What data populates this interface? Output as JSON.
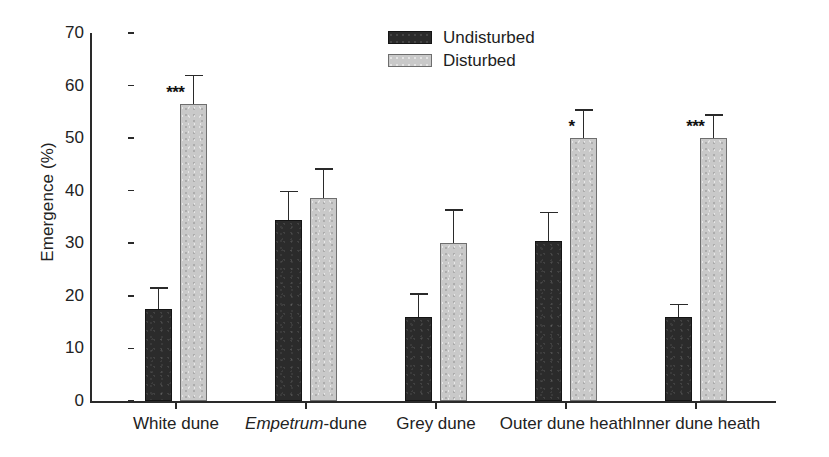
{
  "chart_data": {
    "type": "bar",
    "title": "",
    "xlabel": "",
    "ylabel": "Emergence (%)",
    "ylim": [
      0,
      70
    ],
    "yticks": [
      0,
      10,
      20,
      30,
      40,
      50,
      60,
      70
    ],
    "grid": false,
    "legend_position": "top-center-right",
    "categories": [
      "White dune",
      "Empetrum-dune",
      "Grey dune",
      "Outer dune heath",
      "Inner dune heath"
    ],
    "categories_html": [
      "White dune",
      "<i>Empetrum</i>-dune",
      "Grey dune",
      "Outer dune heath",
      "Inner dune heath"
    ],
    "series": [
      {
        "name": "Undisturbed",
        "color": "#2b2b2b",
        "values": [
          17.5,
          34.5,
          16.0,
          30.5,
          16.0
        ],
        "errors": [
          4.2,
          5.5,
          4.5,
          5.5,
          2.5
        ]
      },
      {
        "name": "Disturbed",
        "color": "#c9c9c9",
        "values": [
          56.5,
          38.6,
          30.0,
          50.0,
          50.0
        ],
        "errors": [
          5.6,
          5.7,
          6.5,
          5.5,
          4.6
        ]
      }
    ],
    "annotations": [
      {
        "category": "White dune",
        "series": "Disturbed",
        "text": "***"
      },
      {
        "category": "Outer dune heath",
        "series": "Disturbed",
        "text": "*"
      },
      {
        "category": "Inner dune heath",
        "series": "Disturbed",
        "text": "***"
      }
    ]
  },
  "legend": {
    "items": [
      {
        "label": "Undisturbed",
        "swatch": "dark"
      },
      {
        "label": "Disturbed",
        "swatch": "light"
      }
    ]
  },
  "axes": {
    "y_label": "Emergence (%)",
    "y_tick_labels": [
      "70",
      "60",
      "50",
      "40",
      "30",
      "20",
      "10",
      "0"
    ]
  }
}
